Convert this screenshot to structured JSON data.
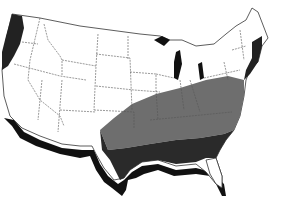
{
  "map": {
    "subject": "Continental United States",
    "style": "grayscale",
    "colors": {
      "background": "#ffffff",
      "land": "#ffffff",
      "shadow": "#111111",
      "dark_region": "#2a2a2a",
      "medium_region": "#6e6e6e",
      "state_border": "#555555",
      "water": "#111111"
    },
    "regions": [
      {
        "name": "southeast-dark-zone",
        "shade": "dark",
        "description": "Deep South (TX east through SC/GA, excluding FL peninsula)"
      },
      {
        "name": "upper-south-medium-zone",
        "shade": "medium",
        "description": "Band across TN/KY/VA/NC up to Atlantic coast"
      },
      {
        "name": "pacific-northwest-dark-zone",
        "shade": "dark",
        "description": "Western WA/OR coastal strip"
      }
    ]
  }
}
